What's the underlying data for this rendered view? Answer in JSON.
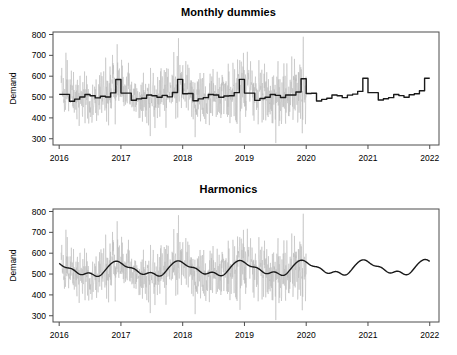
{
  "figure": {
    "width": 457,
    "height": 355,
    "background": "#ffffff"
  },
  "colors": {
    "observed": "#b8b8b8",
    "fit": "#1a1a1a",
    "axis": "#4d4d4d",
    "text": "#000000"
  },
  "panels": [
    {
      "id": "top",
      "title": "Monthly dummies"
    },
    {
      "id": "bottom",
      "title": "Harmonics"
    }
  ],
  "chart_data": [
    {
      "type": "line",
      "title": "Monthly dummies",
      "xlabel": "",
      "ylabel": "Demand",
      "xlim": [
        2015.9,
        2022.15
      ],
      "ylim": [
        270,
        812
      ],
      "xticks": [
        2016,
        2017,
        2018,
        2019,
        2020,
        2021,
        2022
      ],
      "xticklabels": [
        "2016",
        "2017",
        "2018",
        "2019",
        "2020",
        "2021",
        "2022"
      ],
      "yticks": [
        300,
        400,
        500,
        600,
        700,
        800
      ],
      "yticklabels": [
        "300",
        "400",
        "500",
        "600",
        "700",
        "800"
      ],
      "grid": false,
      "legend": "none",
      "series": [
        {
          "name": "Observed daily demand",
          "color": "#b8b8b8",
          "kind": "noisy-daily",
          "x_start": 2016.03,
          "x_end": 2020.0,
          "baseline": 505,
          "noise_sd": 52,
          "trend_per_year": 4,
          "spike_growth": 1.55,
          "seasonal_amp": 26
        },
        {
          "name": "Monthly dummy fit / forecast",
          "color": "#1a1a1a",
          "kind": "monthly-step",
          "x_start": 2016.0,
          "x_end": 2022.0,
          "month_values": [
            513,
            513,
            480,
            490,
            500,
            512,
            506,
            496,
            504,
            500,
            520,
            584,
            519,
            519,
            485,
            491,
            494,
            510,
            506,
            499,
            508,
            501,
            522,
            585,
            516,
            517,
            482,
            491,
            497,
            512,
            510,
            499,
            505,
            506,
            521,
            585,
            519,
            519,
            484,
            493,
            499,
            512,
            508,
            498,
            510,
            510,
            524,
            588,
            517,
            518,
            481,
            489,
            494,
            510,
            506,
            497,
            509,
            514,
            527,
            590,
            521,
            521,
            486,
            492,
            497,
            512,
            507,
            499,
            511,
            516,
            530,
            590
          ]
        }
      ]
    },
    {
      "type": "line",
      "title": "Harmonics",
      "xlabel": "",
      "ylabel": "Demand",
      "xlim": [
        2015.9,
        2022.15
      ],
      "ylim": [
        270,
        812
      ],
      "xticks": [
        2016,
        2017,
        2018,
        2019,
        2020,
        2021,
        2022
      ],
      "xticklabels": [
        "2016",
        "2017",
        "2018",
        "2019",
        "2020",
        "2021",
        "2022"
      ],
      "yticks": [
        300,
        400,
        500,
        600,
        700,
        800
      ],
      "yticklabels": [
        "300",
        "400",
        "500",
        "600",
        "700",
        "800"
      ],
      "grid": false,
      "legend": "none",
      "series": [
        {
          "name": "Observed daily demand",
          "color": "#b8b8b8",
          "kind": "noisy-daily",
          "x_start": 2016.03,
          "x_end": 2020.0,
          "baseline": 505,
          "noise_sd": 52,
          "trend_per_year": 4,
          "spike_growth": 1.55,
          "seasonal_amp": 26
        },
        {
          "name": "Harmonic regression fit / forecast",
          "color": "#1a1a1a",
          "kind": "harmonic",
          "x_start": 2016.0,
          "x_end": 2022.0,
          "mean": 520,
          "trend_per_year": 1.6,
          "harmonics": [
            {
              "period_years": 1.0,
              "amplitude": 30.0,
              "phase": 0.12
            },
            {
              "period_years": 0.5,
              "amplitude": 10.0,
              "phase": 1.05
            },
            {
              "period_years": 0.33333,
              "amplitude": 6.5,
              "phase": 2.4
            },
            {
              "period_years": 0.25,
              "amplitude": 3.0,
              "phase": 0.6
            }
          ]
        }
      ]
    }
  ]
}
